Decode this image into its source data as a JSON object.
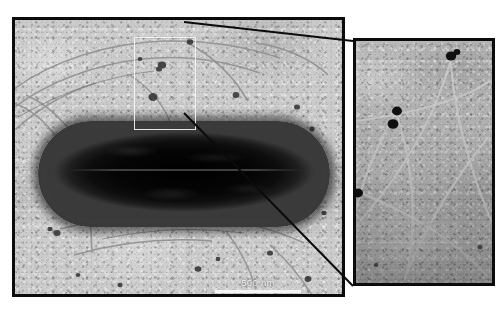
{
  "figure": {
    "kind": "tem-micrograph"
  },
  "panels": [
    {
      "id": "overview",
      "name": "overview-panel",
      "scalebar": {
        "label": "500 nm",
        "value": 500,
        "unit": "nm",
        "bar_px": 86,
        "color": "#f4f4f4"
      },
      "roi_box": {
        "name": "region-of-interest-box",
        "color": "#f5f5f5",
        "x": 122,
        "y": 20,
        "w": 62,
        "h": 93
      },
      "specimen": {
        "name": "bacterium-cell",
        "shape": "rod",
        "color": "#050505",
        "x": 26,
        "y": 104,
        "w": 292,
        "h": 106
      },
      "background_color": "#cbcbcb",
      "border_color": "#0b0b0b"
    },
    {
      "id": "magnified-inset",
      "name": "inset-panel",
      "scalebar": {
        "label": "100 nm",
        "value": 100,
        "unit": "nm",
        "bar_px": 62,
        "color": "#ffffff"
      },
      "background_color": "#bdbdbd",
      "border_color": "#0b0b0b",
      "features": "flagellar filaments with dark electron-dense particles at junction points"
    }
  ],
  "connectors": {
    "name": "inset-connector-lines",
    "color": "#0b0b0b",
    "count": 2
  },
  "colors": {
    "frame": "#0b0b0b",
    "background_left": "#cbcbcb",
    "background_right": "#bdbdbd",
    "cell": "#050505",
    "scalebar": "#ffffff",
    "roi": "#f5f5f5",
    "page": "#ffffff"
  }
}
